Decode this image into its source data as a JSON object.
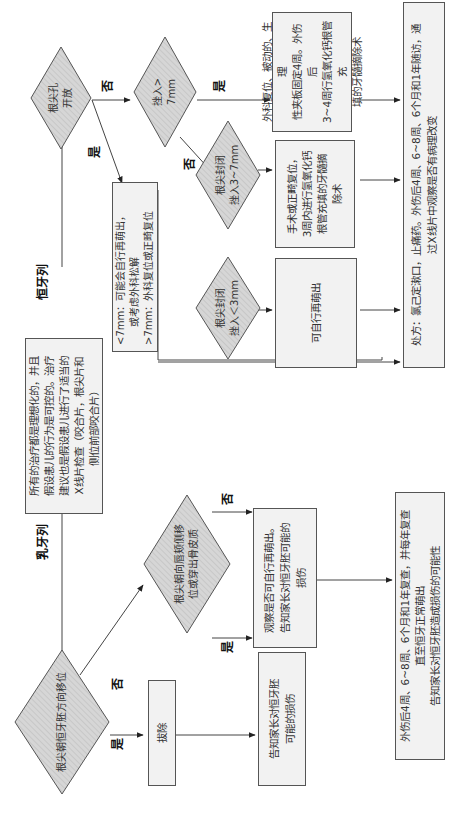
{
  "orientation": "rotated 90 degrees counter-clockwise",
  "colors": {
    "box_fill": "#f2f2f2",
    "diamond_fill": "#d6d6d6",
    "diamond_hatch": "#bdbdbd",
    "stroke": "#555555",
    "text": "#333333"
  },
  "start_box": {
    "lines": [
      "所有的治疗都是理想化的，并且",
      "假设患儿的行为是可控的。治疗",
      "建议也是假设患儿进行了适当的",
      "X线片检查（咬合片，根尖片和",
      "侧位前部咬合片）"
    ]
  },
  "branches": {
    "permanent": "恒牙列",
    "primary": "乳牙列"
  },
  "permanent": {
    "d_apex_open": {
      "lines": [
        "根尖孔",
        "开放"
      ]
    },
    "yes_label": "是",
    "no_label": "否",
    "d_intrusion_gt7": {
      "lines": [
        "挫入>",
        "7mm"
      ]
    },
    "yes_label_2": "是",
    "no_label_2": "否",
    "d_closed_3_7": {
      "lines": [
        "根尖封闭",
        "挫入3~7mm"
      ]
    },
    "d_closed_lt3": {
      "lines": [
        "根尖封闭",
        "挫入＜3mm"
      ]
    },
    "box_open_apex": {
      "lines": [
        "<7mm：可能会自行再萌出，",
        "或考虑外科松解",
        ">7mm：外科复位或正畸复位"
      ]
    },
    "box_gt7": {
      "lines": [
        "外科复位、被动的、生理",
        "性夹板固定4周。外伤后",
        "3~4周行氢氧化钙根管充",
        "填的牙髓摘除术"
      ]
    },
    "box_3_7": {
      "lines": [
        "手术或正畸复位，",
        "3周内进行氢氧化钙",
        "根管充填的牙髓摘",
        "除术"
      ]
    },
    "box_lt3": {
      "lines": [
        "可自行再萌出"
      ]
    },
    "box_prescription": {
      "lines": [
        "处方：氯己定漱口，止痛药。外伤后4周、6~8周、6个月和1年随访，通",
        "过X线片中观察是否有病理改变"
      ]
    }
  },
  "primary": {
    "d_toward_germ": {
      "lines": [
        "根尖朝恒牙胚方向移位"
      ]
    },
    "yes_label": "是",
    "no_label": "否",
    "box_extract": {
      "lines": [
        "拔除"
      ]
    },
    "box_inform_extract": {
      "lines": [
        "告知家长对恒牙胚",
        "可能的损伤"
      ]
    },
    "d_labial": {
      "lines": [
        "根尖朝向唇颊侧移",
        "位或穿出骨皮质"
      ]
    },
    "yes_label_2": "是",
    "no_label_2": "否",
    "box_observe": {
      "lines": [
        "观察是否可自行再萌出。",
        "告知家长对恒牙胚可能的",
        "损伤"
      ]
    },
    "box_followup": {
      "lines": [
        "外伤后4周、6~8周、6个月和1年复查，并每年复查",
        "直至恒牙正常萌出",
        "告知家长对恒牙胚造成损伤的可能性"
      ]
    }
  }
}
